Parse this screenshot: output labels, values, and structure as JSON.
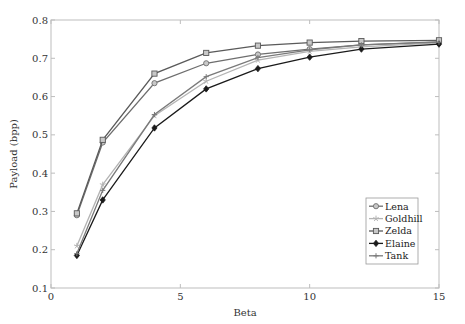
{
  "chart_data": {
    "type": "line",
    "title": "",
    "xlabel": "Beta",
    "ylabel": "Payload (bpp)",
    "xlim": [
      0,
      15
    ],
    "ylim": [
      0.1,
      0.8
    ],
    "xticks": [
      0,
      5,
      10,
      15
    ],
    "yticks": [
      0.1,
      0.2,
      0.3,
      0.4,
      0.5,
      0.6,
      0.7,
      0.8
    ],
    "xtick_labels": [
      "0",
      "5",
      "10",
      "15"
    ],
    "ytick_labels": [
      "0.1",
      "0.2",
      "0.3",
      "0.4",
      "0.5",
      "0.6",
      "0.7",
      "0.8"
    ],
    "grid": false,
    "legend_position": "lower right",
    "x": [
      1,
      2,
      4,
      6,
      8,
      10,
      12,
      15
    ],
    "series": [
      {
        "name": "Lena",
        "marker": "circle",
        "color": "#6e6e6e",
        "values": [
          0.29,
          0.48,
          0.635,
          0.687,
          0.71,
          0.724,
          0.735,
          0.743
        ]
      },
      {
        "name": "Goldhill",
        "marker": "star",
        "color": "#b4b4b4",
        "values": [
          0.21,
          0.37,
          0.55,
          0.64,
          0.695,
          0.718,
          0.73,
          0.74
        ]
      },
      {
        "name": "Zelda",
        "marker": "square",
        "color": "#5a5a5a",
        "values": [
          0.295,
          0.487,
          0.66,
          0.714,
          0.733,
          0.741,
          0.745,
          0.747
        ]
      },
      {
        "name": "Elaine",
        "marker": "diamond",
        "color": "#1a1a1a",
        "values": [
          0.185,
          0.33,
          0.518,
          0.62,
          0.673,
          0.703,
          0.724,
          0.737
        ]
      },
      {
        "name": "Tank",
        "marker": "plus",
        "color": "#7a7a7a",
        "values": [
          0.19,
          0.355,
          0.553,
          0.652,
          0.702,
          0.722,
          0.735,
          0.742
        ]
      }
    ]
  },
  "layout": {
    "plot": {
      "left": 51,
      "top": 20,
      "right": 439,
      "bottom": 288
    },
    "legend": {
      "left": 366,
      "top": 198,
      "width": 52,
      "height": 66
    }
  }
}
